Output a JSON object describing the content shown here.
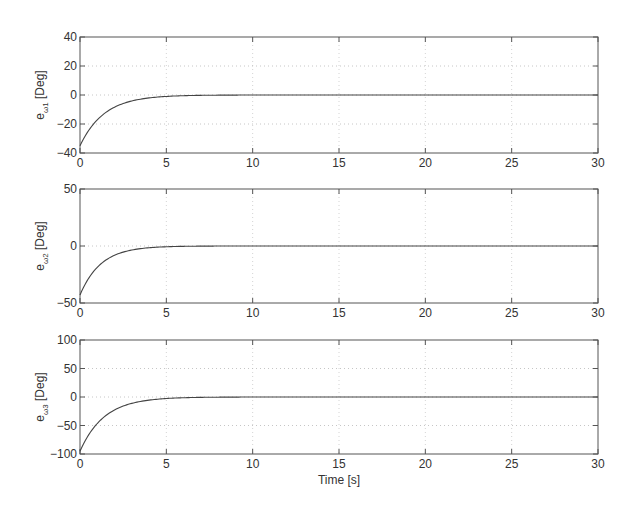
{
  "chart_data": [
    {
      "type": "line",
      "ylabel": "e_ω1 [Deg]",
      "ylabel_main": "e",
      "ylabel_sub": "ω1",
      "ylabel_unit": " [Deg]",
      "xlabel": "",
      "xlim": [
        0,
        30
      ],
      "ylim": [
        -40,
        40
      ],
      "xticks": [
        "0",
        "5",
        "10",
        "15",
        "20",
        "25",
        "30"
      ],
      "yticks": [
        "40",
        "20",
        "0",
        "-20",
        "-40"
      ],
      "grid": true,
      "series": [
        {
          "name": "e_ω1",
          "initial": -35,
          "final": 0,
          "tau": 1.4,
          "x": [
            0,
            1,
            2,
            3,
            4,
            5,
            6,
            8,
            10,
            15,
            20,
            25,
            30
          ],
          "values": [
            -35,
            -17,
            -8.4,
            -4.1,
            -2.0,
            -1.0,
            -0.5,
            -0.1,
            0,
            0,
            0,
            0,
            0
          ]
        }
      ]
    },
    {
      "type": "line",
      "ylabel": "e_ω2 [Deg]",
      "ylabel_main": "e",
      "ylabel_sub": "ω2",
      "ylabel_unit": " [Deg]",
      "xlabel": "",
      "xlim": [
        0,
        30
      ],
      "ylim": [
        -50,
        50
      ],
      "xticks": [
        "0",
        "5",
        "10",
        "15",
        "20",
        "25",
        "30"
      ],
      "yticks": [
        "50",
        "0",
        "-50"
      ],
      "grid": true,
      "series": [
        {
          "name": "e_ω2",
          "initial": -43,
          "final": 0,
          "tau": 1.2,
          "x": [
            0,
            1,
            2,
            3,
            4,
            5,
            6,
            8,
            10,
            15,
            20,
            25,
            30
          ],
          "values": [
            -43,
            -19,
            -8.1,
            -3.5,
            -1.5,
            -0.7,
            -0.3,
            0,
            0,
            0,
            0,
            0,
            0
          ]
        }
      ]
    },
    {
      "type": "line",
      "ylabel": "e_ω3 [Deg]",
      "ylabel_main": "e",
      "ylabel_sub": "ω3",
      "ylabel_unit": " [Deg]",
      "xlabel": "Time [s]",
      "xlim": [
        0,
        30
      ],
      "ylim": [
        -100,
        100
      ],
      "xticks": [
        "0",
        "5",
        "10",
        "15",
        "20",
        "25",
        "30"
      ],
      "yticks": [
        "100",
        "50",
        "0",
        "-50",
        "-100"
      ],
      "grid": true,
      "series": [
        {
          "name": "e_ω3",
          "initial": -95,
          "final": 0,
          "tau": 1.4,
          "x": [
            0,
            1,
            2,
            3,
            4,
            5,
            6,
            8,
            10,
            15,
            20,
            25,
            30
          ],
          "values": [
            -95,
            -46,
            -23,
            -11,
            -5.5,
            -2.7,
            -1.3,
            -0.3,
            0,
            0,
            0,
            0,
            0
          ]
        }
      ]
    }
  ]
}
